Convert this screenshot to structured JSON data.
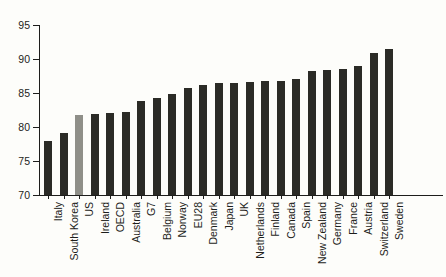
{
  "chart_data": {
    "type": "bar",
    "title": "",
    "subtitle": "",
    "xlabel": "",
    "ylabel": "",
    "ylim": [
      70,
      95
    ],
    "yticks": [
      70,
      75,
      80,
      85,
      90,
      95
    ],
    "ytick_labels": [
      "70",
      "75",
      "80",
      "85",
      "90",
      "95"
    ],
    "grid": false,
    "legend": "none",
    "highlight_category": "US",
    "colors": {
      "bar": "#2b2b26",
      "highlight": "#8f8f88",
      "axis": "#1d1d1b",
      "background": "#fdfdfa"
    },
    "categories": [
      "Italy",
      "South Korea",
      "US",
      "Ireland",
      "OECD",
      "Australia",
      "G7",
      "Belgium",
      "Norway",
      "EU28",
      "Denmark",
      "Japan",
      "UK",
      "Netherlands",
      "Finland",
      "Canada",
      "Spain",
      "New Zealand",
      "Germany",
      "France",
      "Austria",
      "Switzerland",
      "Sweden"
    ],
    "values": [
      78.0,
      79.1,
      81.7,
      81.9,
      82.1,
      82.2,
      83.8,
      84.2,
      84.9,
      85.7,
      86.2,
      86.5,
      86.5,
      86.6,
      86.8,
      86.8,
      87.0,
      88.3,
      88.4,
      88.5,
      88.9,
      90.9,
      91.5
    ]
  }
}
